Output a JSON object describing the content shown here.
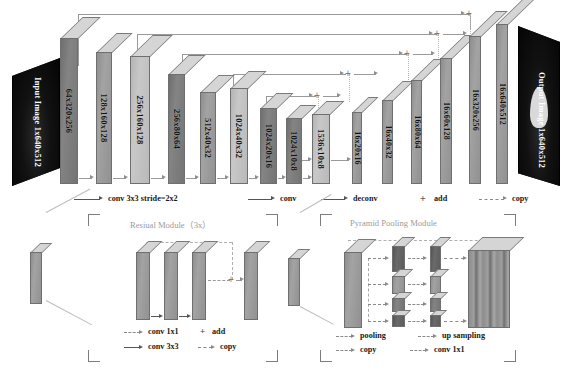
{
  "figure": {
    "input": {
      "name": "Input Image",
      "shape": "1x640x512"
    },
    "output": {
      "name": "Output Image",
      "shape": "1x640x512"
    }
  },
  "encoder": {
    "blocks": [
      {
        "label": "64x320x256"
      },
      {
        "label": "128x160x128"
      },
      {
        "label": "256x160x128"
      },
      {
        "label": "256x80x64"
      },
      {
        "label": "512x40x32"
      },
      {
        "label": "1024x40x32"
      },
      {
        "label": "1024x20x16"
      },
      {
        "label": "1024x10x8"
      },
      {
        "label": "1536x10x8"
      }
    ]
  },
  "decoder": {
    "blocks": [
      {
        "label": "16x20x16"
      },
      {
        "label": "16x40x32"
      },
      {
        "label": "16x80x64"
      },
      {
        "label": "16x60x128"
      },
      {
        "label": "16x320x256"
      },
      {
        "label": "16x640x512"
      }
    ]
  },
  "legend": {
    "items": [
      {
        "label": "conv 3x3 stride=2x2",
        "style": "solid-arrow"
      },
      {
        "label": "conv",
        "style": "solid-arrow"
      },
      {
        "label": "deconv",
        "style": "solid-arrow"
      },
      {
        "label": "add",
        "style": "plus"
      },
      {
        "label": "copy",
        "style": "dashed-arrow"
      }
    ],
    "plus_symbol": "+"
  },
  "residual_panel": {
    "title": "Resiual Module（3x）",
    "legend": [
      {
        "label": "conv 1x1",
        "style": "dashed-arrow"
      },
      {
        "label": "add",
        "style": "plus"
      },
      {
        "label": "conv 3x3",
        "style": "solid-arrow"
      },
      {
        "label": "copy",
        "style": "dashed-arrow"
      }
    ],
    "plus_symbol": "+"
  },
  "pyramid_panel": {
    "title": "Pyramid Pooling Module",
    "legend": [
      {
        "label": "pooling",
        "style": "dashed-arrow"
      },
      {
        "label": "up sampling",
        "style": "dashed-arrow"
      },
      {
        "label": "copy",
        "style": "dashed-arrow"
      },
      {
        "label": "conv 1x1",
        "style": "dashed-arrow"
      }
    ]
  },
  "colors": {
    "slab_face": "#9a9a9a",
    "slab_top": "#d5d5d5",
    "slab_light": "#bfbfbf",
    "slab_dark": "#747474",
    "line": "#9a9a9a",
    "dashed": "#b5b5b5",
    "panel_title": "#9b9b9b",
    "plane": "#0b0b0b"
  }
}
